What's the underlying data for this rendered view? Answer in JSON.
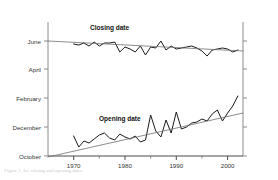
{
  "figure": {
    "caption_text": "Figure 1. Ice closing and opening dates"
  },
  "chart_data": {
    "type": "line",
    "title": "",
    "xlabel": "",
    "ylabel": "",
    "xlim": [
      1965,
      2003
    ],
    "xticks": [
      1970,
      1980,
      1990,
      2000
    ],
    "xticklabels": [
      "1970",
      "1980",
      "1990",
      "2000"
    ],
    "xminorticks": [
      1975,
      1985,
      1995
    ],
    "yticks": [
      41,
      69,
      98,
      127,
      156
    ],
    "yticklabels": [
      "June",
      "April",
      "February",
      "December",
      "October"
    ],
    "grid": false,
    "legend": "inline-annotations",
    "annotations": [
      {
        "text": "Closing date",
        "x": 1977,
        "y": 30
      },
      {
        "text": "Opening date",
        "x": 1979,
        "y": 121
      }
    ],
    "series": [
      {
        "name": "Closing date",
        "type": "line",
        "color": "#1a1a1a",
        "x": [
          1970,
          1971,
          1972,
          1973,
          1974,
          1975,
          1976,
          1977,
          1978,
          1979,
          1980,
          1981,
          1982,
          1983,
          1984,
          1985,
          1986,
          1987,
          1988,
          1989,
          1990,
          1991,
          1992,
          1993,
          1994,
          1995,
          1996,
          1997,
          1998,
          1999,
          2000,
          2001,
          2002
        ],
        "y": [
          44,
          45,
          43,
          46,
          42,
          46,
          43,
          43,
          42,
          52,
          47,
          49,
          52,
          46,
          55,
          47,
          48,
          41,
          50,
          46,
          49,
          48,
          47,
          46,
          48,
          51,
          56,
          50,
          49,
          48,
          49,
          52,
          50
        ]
      },
      {
        "name": "Closing date trend",
        "type": "trend",
        "color": "#6e6e6e",
        "x": [
          1965,
          2003
        ],
        "y": [
          41,
          51
        ]
      },
      {
        "name": "Opening date",
        "type": "line",
        "color": "#1a1a1a",
        "x": [
          1970,
          1971,
          1972,
          1973,
          1974,
          1975,
          1976,
          1977,
          1978,
          1979,
          1980,
          1981,
          1982,
          1983,
          1984,
          1985,
          1986,
          1987,
          1988,
          1989,
          1990,
          1991,
          1992,
          1993,
          1994,
          1995,
          1996,
          1997,
          1998,
          1999,
          2000,
          2001,
          2002
        ],
        "y": [
          136,
          147,
          141,
          143,
          139,
          135,
          133,
          138,
          140,
          134,
          137,
          139,
          136,
          142,
          140,
          115,
          131,
          137,
          120,
          133,
          112,
          129,
          127,
          123,
          122,
          119,
          121,
          114,
          110,
          121,
          113,
          106,
          96
        ]
      },
      {
        "name": "Opening date trend",
        "type": "trend",
        "color": "#6e6e6e",
        "x": [
          1965,
          2003
        ],
        "y": [
          157,
          113
        ]
      }
    ]
  }
}
